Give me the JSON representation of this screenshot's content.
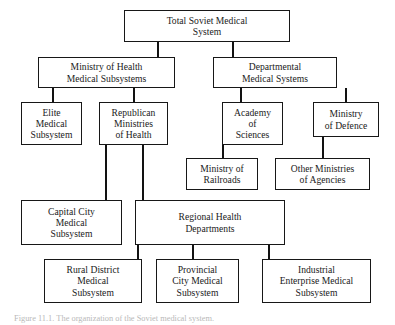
{
  "figure": {
    "caption": "Figure 11.1.  The organization of the Soviet medical system.",
    "caption_visible_note": "clipped at bottom edge"
  },
  "diagram": {
    "type": "organizational-hierarchy-chart",
    "orientation": "top-down",
    "line_color": "#121212",
    "box_border_color": "#171717",
    "box_fill_color": "#ffffff",
    "text_color": "#1a1a1a",
    "nodes": [
      {
        "id": "total-soviet-medical-system",
        "label": "Total Soviet Medical\nSystem",
        "level": 1,
        "x": 124,
        "y": 10,
        "w": 166,
        "h": 32
      },
      {
        "id": "ministry-of-health-medical-subsystems",
        "label": "Ministry of Health\nMedical Subsystems",
        "level": 2,
        "x": 38,
        "y": 57,
        "w": 137,
        "h": 31
      },
      {
        "id": "departmental-medical-systems",
        "label": "Departmental\nMedical Systems",
        "level": 2,
        "x": 213,
        "y": 57,
        "w": 124,
        "h": 31
      },
      {
        "id": "elite-medical-subsystem",
        "label": "Elite\nMedical\nSubsystem",
        "level": 3,
        "x": 21,
        "y": 102,
        "w": 61,
        "h": 43
      },
      {
        "id": "republican-ministries-of-health",
        "label": "Republican\nMinistries\nof Health",
        "level": 3,
        "x": 99,
        "y": 102,
        "w": 69,
        "h": 43
      },
      {
        "id": "academy-of-sciences",
        "label": "Academy\nof\nSciences",
        "level": 3,
        "x": 222,
        "y": 102,
        "w": 61,
        "h": 43
      },
      {
        "id": "ministry-of-defence",
        "label": "Ministry\nof Defence",
        "level": 3,
        "x": 313,
        "y": 102,
        "w": 66,
        "h": 35
      },
      {
        "id": "ministry-of-railroads",
        "label": "Ministry of\nRailroads",
        "level": 4,
        "x": 186,
        "y": 158,
        "w": 72,
        "h": 32
      },
      {
        "id": "other-ministries-of-agencies",
        "label": "Other Ministries\nof Agencies",
        "level": 4,
        "x": 275,
        "y": 158,
        "w": 95,
        "h": 32
      },
      {
        "id": "capital-city-medical-subsystem",
        "label": "Capital City\nMedical\nSubsystem",
        "level": 5,
        "x": 21,
        "y": 200,
        "w": 101,
        "h": 45
      },
      {
        "id": "regional-health-departments",
        "label": "Regional Health\nDepartments",
        "level": 5,
        "x": 135,
        "y": 200,
        "w": 150,
        "h": 45
      },
      {
        "id": "rural-district-medical-subsystem",
        "label": "Rural District\nMedical\nSubsystem",
        "level": 6,
        "x": 44,
        "y": 259,
        "w": 98,
        "h": 44
      },
      {
        "id": "provincial-city-medical-subsystem",
        "label": "Provincial\nCity Medical\nSubsystem",
        "level": 6,
        "x": 156,
        "y": 259,
        "w": 83,
        "h": 44
      },
      {
        "id": "industrial-enterprise-medical-subsystem",
        "label": "Industrial\nEnterprise Medical\nSubsystem",
        "level": 6,
        "x": 262,
        "y": 259,
        "w": 109,
        "h": 44
      }
    ],
    "edges": [
      {
        "from": "total-soviet-medical-system",
        "to": "ministry-of-health-medical-subsystems"
      },
      {
        "from": "total-soviet-medical-system",
        "to": "departmental-medical-systems"
      },
      {
        "from": "ministry-of-health-medical-subsystems",
        "to": "elite-medical-subsystem"
      },
      {
        "from": "ministry-of-health-medical-subsystems",
        "to": "republican-ministries-of-health"
      },
      {
        "from": "departmental-medical-systems",
        "to": "academy-of-sciences"
      },
      {
        "from": "departmental-medical-systems",
        "to": "ministry-of-defence"
      },
      {
        "from": "academy-of-sciences",
        "to": "ministry-of-railroads"
      },
      {
        "from": "ministry-of-defence",
        "to": "other-ministries-of-agencies"
      },
      {
        "from": "republican-ministries-of-health",
        "to": "capital-city-medical-subsystem"
      },
      {
        "from": "republican-ministries-of-health",
        "to": "regional-health-departments"
      },
      {
        "from": "regional-health-departments",
        "to": "rural-district-medical-subsystem"
      },
      {
        "from": "regional-health-departments",
        "to": "provincial-city-medical-subsystem"
      },
      {
        "from": "regional-health-departments",
        "to": "industrial-enterprise-medical-subsystem"
      }
    ],
    "connector_segments": [
      {
        "id": "seg-top-to-moh",
        "orient": "v",
        "x": 157,
        "y": 42,
        "len": 15
      },
      {
        "id": "seg-top-to-dept",
        "orient": "v",
        "x": 232,
        "y": 42,
        "len": 15
      },
      {
        "id": "seg-moh-to-elite",
        "orient": "v",
        "x": 52,
        "y": 88,
        "len": 14
      },
      {
        "id": "seg-moh-to-republican",
        "orient": "v",
        "x": 133,
        "y": 88,
        "len": 14
      },
      {
        "id": "seg-dept-to-academy",
        "orient": "v",
        "x": 240,
        "y": 88,
        "len": 14
      },
      {
        "id": "seg-dept-to-defence",
        "orient": "v",
        "x": 345,
        "y": 88,
        "len": 14
      },
      {
        "id": "seg-academy-to-rail",
        "orient": "v",
        "x": 222,
        "y": 145,
        "len": 13
      },
      {
        "id": "seg-defence-to-other",
        "orient": "v",
        "x": 322,
        "y": 137,
        "len": 21
      },
      {
        "id": "seg-republican-to-cap",
        "orient": "v",
        "x": 105,
        "y": 145,
        "len": 55
      },
      {
        "id": "seg-republican-to-reg",
        "orient": "v",
        "x": 142,
        "y": 145,
        "len": 55
      },
      {
        "id": "seg-reg-to-rural",
        "orient": "v",
        "x": 137,
        "y": 245,
        "len": 14
      },
      {
        "id": "seg-reg-to-provincial",
        "orient": "v",
        "x": 192,
        "y": 245,
        "len": 14
      },
      {
        "id": "seg-reg-to-industrial",
        "orient": "v",
        "x": 268,
        "y": 245,
        "len": 14
      }
    ]
  }
}
